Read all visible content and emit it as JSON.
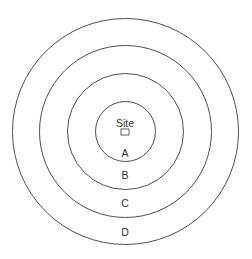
{
  "diagram": {
    "title": "",
    "center": {
      "x": 125.5,
      "y": 131.5
    },
    "stroke_color": "#3a3a3a",
    "text_color": "#333333",
    "site": {
      "label": "Site",
      "label_pos": {
        "x": 125,
        "y": 127
      },
      "marker": {
        "x": 121,
        "y": 129,
        "width": 8,
        "height": 6
      }
    },
    "rings": [
      {
        "id": "A",
        "radius": 30,
        "label": "A",
        "label_pos": {
          "x": 125,
          "y": 157
        }
      },
      {
        "id": "B",
        "radius": 58,
        "label": "B",
        "label_pos": {
          "x": 125,
          "y": 179
        }
      },
      {
        "id": "C",
        "radius": 86,
        "label": "C",
        "label_pos": {
          "x": 125,
          "y": 207
        }
      },
      {
        "id": "D",
        "radius": 113,
        "label": "D",
        "label_pos": {
          "x": 125,
          "y": 236
        }
      }
    ]
  }
}
